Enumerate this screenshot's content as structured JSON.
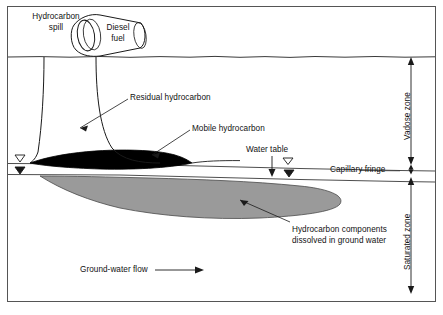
{
  "figure": {
    "title_label": "Hydrocarbon\nspill",
    "drum_label": "Diesel\nfuel",
    "labels": {
      "residual": "Residual hydrocarbon",
      "mobile": "Mobile hydrocarbon",
      "water_table": "Water table",
      "dissolved_line1": "Hydrocarbon components",
      "dissolved_line2": "dissolved in ground water",
      "ground_water_flow": "Ground-water flow"
    },
    "zones": {
      "vadose": "Vadose zone",
      "capillary": "Capillary fringe",
      "saturated": "Saturated zone"
    },
    "colors": {
      "mobile_hydrocarbon": "#000000",
      "dissolved_plume": "#9a9a9a",
      "outline": "#000000",
      "border": "#555555",
      "background": "#ffffff"
    }
  }
}
